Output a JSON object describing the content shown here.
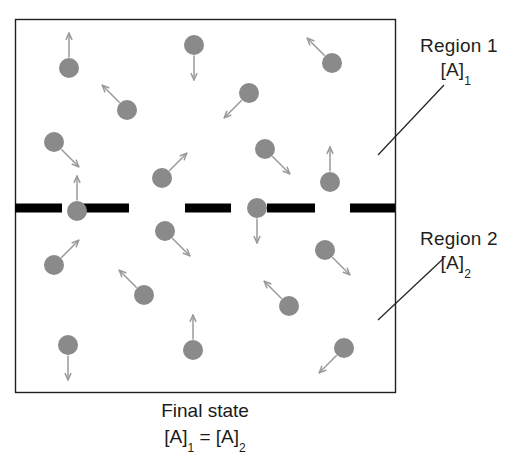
{
  "figure": {
    "kind": "diffusion-equilibrium-diagram",
    "container": {
      "x": 15,
      "y": 19,
      "w": 380,
      "h": 373,
      "border_color": "#231f20",
      "fill": "#ffffff"
    },
    "membrane": {
      "y": 208,
      "thickness": 9,
      "color": "#000000",
      "segments": [
        {
          "x": 15,
          "w": 47
        },
        {
          "x": 82,
          "w": 47
        },
        {
          "x": 185,
          "w": 46
        },
        {
          "x": 267,
          "w": 48
        },
        {
          "x": 350,
          "w": 45
        }
      ]
    },
    "particle": {
      "radius": 10,
      "color": "#8a8a8a",
      "arrow_color": "#9a9a9a",
      "arrow_length": 24
    },
    "particles": [
      {
        "id": 1,
        "x": 69,
        "y": 68,
        "dir": "up",
        "region": 1
      },
      {
        "id": 2,
        "x": 194,
        "y": 45,
        "dir": "down",
        "region": 1
      },
      {
        "id": 3,
        "x": 332,
        "y": 63,
        "dir": "up-left",
        "region": 1
      },
      {
        "id": 4,
        "x": 127,
        "y": 110,
        "dir": "up-left",
        "region": 1
      },
      {
        "id": 5,
        "x": 249,
        "y": 93,
        "dir": "down-left",
        "region": 1
      },
      {
        "id": 6,
        "x": 54,
        "y": 142,
        "dir": "down-right",
        "region": 1
      },
      {
        "id": 7,
        "x": 265,
        "y": 149,
        "dir": "down-right",
        "region": 1
      },
      {
        "id": 8,
        "x": 162,
        "y": 178,
        "dir": "up-right",
        "region": 1
      },
      {
        "id": 9,
        "x": 330,
        "y": 182,
        "dir": "up",
        "region": 1
      },
      {
        "id": 10,
        "x": 77,
        "y": 211,
        "dir": "up",
        "region": 1
      },
      {
        "id": 11,
        "x": 257,
        "y": 208,
        "dir": "down",
        "region": 2
      },
      {
        "id": 12,
        "x": 165,
        "y": 231,
        "dir": "down-right",
        "region": 2
      },
      {
        "id": 13,
        "x": 325,
        "y": 250,
        "dir": "down-right",
        "region": 2
      },
      {
        "id": 14,
        "x": 54,
        "y": 265,
        "dir": "up-right",
        "region": 2
      },
      {
        "id": 15,
        "x": 144,
        "y": 295,
        "dir": "up-left",
        "region": 2
      },
      {
        "id": 16,
        "x": 289,
        "y": 306,
        "dir": "up-left",
        "region": 2
      },
      {
        "id": 17,
        "x": 68,
        "y": 345,
        "dir": "down",
        "region": 2
      },
      {
        "id": 18,
        "x": 193,
        "y": 350,
        "dir": "up",
        "region": 2
      },
      {
        "id": 19,
        "x": 344,
        "y": 348,
        "dir": "down-left",
        "region": 2
      }
    ],
    "leaders": [
      {
        "name": "region-1-leader",
        "x1": 378,
        "y1": 155,
        "x2": 444,
        "y2": 85,
        "color": "#231f20"
      },
      {
        "name": "region-2-leader",
        "x1": 378,
        "y1": 320,
        "x2": 444,
        "y2": 258,
        "color": "#231f20"
      }
    ]
  },
  "labels": {
    "region1": {
      "title": "Region 1",
      "conc_base": "[A]",
      "conc_sub": "1"
    },
    "region2": {
      "title": "Region 2",
      "conc_base": "[A]",
      "conc_sub": "2"
    }
  },
  "caption": {
    "line1": "Final state",
    "eq_left_base": "[A]",
    "eq_left_sub": "1",
    "eq_operator": " = ",
    "eq_right_base": "[A]",
    "eq_right_sub": "2"
  }
}
